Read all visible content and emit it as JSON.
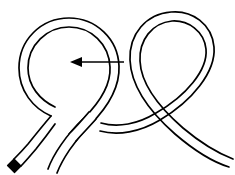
{
  "figure": {
    "background_color": "#ffffff",
    "stroke_color": "#000000",
    "width_px": 235,
    "height_px": 175,
    "caption": ""
  },
  "annotation": {
    "arrow_label": "",
    "arrow_direction": "left",
    "arrow_tail_x": 124,
    "arrow_tail_y": 62,
    "arrow_tip_x": 70,
    "arrow_tip_y": 62
  },
  "elements": {
    "left_loop_label": "",
    "right_loop_label": "",
    "free_end_label": "",
    "tail_label": ""
  },
  "chart_data": {
    "type": "diagram",
    "components": [
      "left-circular-loop",
      "right-teardrop-loop",
      "lower-left-strand-with-end-cap",
      "lower-right-tail-strand",
      "left-pointing-arrow-annotation"
    ],
    "colors": {
      "stroke": "#000000",
      "fill": "#ffffff",
      "end_cap": "#000000"
    }
  }
}
